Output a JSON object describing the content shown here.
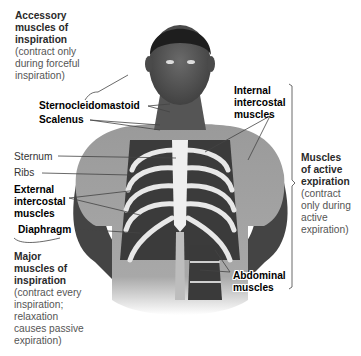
{
  "figure": {
    "left_groups": {
      "accessory": {
        "title_lines": [
          "Accessory",
          "muscles of",
          "inspiration"
        ],
        "note_lines": [
          "(contract only",
          "during forceful",
          "inspiration)"
        ]
      },
      "major": {
        "title_lines": [
          "Major",
          "muscles of",
          "inspiration"
        ],
        "note_lines": [
          "(contract every",
          "inspiration;",
          "relaxation",
          "causes passive",
          "expiration)"
        ]
      }
    },
    "right_group": {
      "title_lines": [
        "Muscles",
        "of active",
        "expiration"
      ],
      "note_lines": [
        "(contract",
        "only during",
        "active",
        "expiration)"
      ]
    },
    "labels": {
      "sternocleidomastoid": "Sternocleidomastoid",
      "scalenus": "Scalenus",
      "sternum": "Sternum",
      "ribs": "Ribs",
      "external_intercostal": [
        "External",
        "intercostal",
        "muscles"
      ],
      "diaphragm": "Diaphragm",
      "internal_intercostal": [
        "Internal",
        "intercostal",
        "muscles"
      ],
      "abdominal": [
        "Abdominal",
        "muscles"
      ]
    }
  }
}
